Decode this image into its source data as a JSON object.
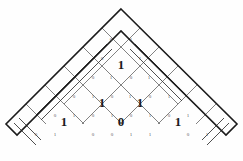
{
  "figure": {
    "type": "diamond-lattice",
    "background_color": "#ffffff",
    "outline_color": "#1b1b1b",
    "grid_color": "#6b6b6b",
    "label_color": "#5a5a5a",
    "digit_color": "#1a1a1a"
  },
  "geometry": {
    "apex": {
      "x": 121,
      "y": 9
    },
    "left_vertex": {
      "x": 6,
      "y": 124
    },
    "right_vertex": {
      "x": 237,
      "y": 124
    },
    "cell_half": 19,
    "rows": 6
  },
  "cells": [
    {
      "id": "cell-r3-c0",
      "x": 121,
      "y": 66,
      "digit": "1"
    },
    {
      "id": "cell-r4-c0",
      "x": 102,
      "y": 104,
      "digit": "1"
    },
    {
      "id": "cell-r4-c1",
      "x": 140,
      "y": 104,
      "digit": "1"
    },
    {
      "id": "cell-r5-c0",
      "x": 64,
      "y": 123,
      "digit": "1"
    },
    {
      "id": "cell-r5-c1",
      "x": 121,
      "y": 123,
      "digit": "0"
    },
    {
      "id": "cell-r5-c2",
      "x": 178,
      "y": 123,
      "digit": "1"
    }
  ],
  "edge_labels": [
    {
      "id": "lbl-1",
      "x": 111,
      "y": 40,
      "text": "0"
    },
    {
      "id": "lbl-2",
      "x": 131,
      "y": 40,
      "text": "1"
    },
    {
      "id": "lbl-3",
      "x": 102,
      "y": 59,
      "text": "0"
    },
    {
      "id": "lbl-4",
      "x": 140,
      "y": 59,
      "text": "1"
    },
    {
      "id": "lbl-5",
      "x": 93,
      "y": 78,
      "text": "0"
    },
    {
      "id": "lbl-6",
      "x": 111,
      "y": 78,
      "text": "1"
    },
    {
      "id": "lbl-7",
      "x": 131,
      "y": 78,
      "text": "0"
    },
    {
      "id": "lbl-8",
      "x": 149,
      "y": 78,
      "text": "1"
    },
    {
      "id": "lbl-9",
      "x": 74,
      "y": 97,
      "text": "0"
    },
    {
      "id": "lbl-10",
      "x": 93,
      "y": 97,
      "text": "1"
    },
    {
      "id": "lbl-11",
      "x": 112,
      "y": 97,
      "text": "0"
    },
    {
      "id": "lbl-12",
      "x": 130,
      "y": 97,
      "text": "1"
    },
    {
      "id": "lbl-13",
      "x": 150,
      "y": 97,
      "text": "0"
    },
    {
      "id": "lbl-14",
      "x": 169,
      "y": 97,
      "text": "1"
    },
    {
      "id": "lbl-15",
      "x": 55,
      "y": 116,
      "text": "0"
    },
    {
      "id": "lbl-16",
      "x": 74,
      "y": 116,
      "text": "1"
    },
    {
      "id": "lbl-17",
      "x": 93,
      "y": 116,
      "text": "0"
    },
    {
      "id": "lbl-18",
      "x": 112,
      "y": 116,
      "text": "1"
    },
    {
      "id": "lbl-19",
      "x": 131,
      "y": 116,
      "text": "0"
    },
    {
      "id": "lbl-20",
      "x": 150,
      "y": 116,
      "text": "1"
    },
    {
      "id": "lbl-21",
      "x": 169,
      "y": 116,
      "text": "0"
    },
    {
      "id": "lbl-22",
      "x": 188,
      "y": 116,
      "text": "1"
    },
    {
      "id": "lbl-23",
      "x": 36,
      "y": 135,
      "text": "0"
    },
    {
      "id": "lbl-24",
      "x": 55,
      "y": 135,
      "text": "1"
    },
    {
      "id": "lbl-25",
      "x": 93,
      "y": 135,
      "text": "0"
    },
    {
      "id": "lbl-26",
      "x": 112,
      "y": 135,
      "text": "0"
    },
    {
      "id": "lbl-27",
      "x": 131,
      "y": 135,
      "text": "1"
    },
    {
      "id": "lbl-28",
      "x": 150,
      "y": 135,
      "text": "1"
    },
    {
      "id": "lbl-29",
      "x": 188,
      "y": 135,
      "text": "0"
    },
    {
      "id": "lbl-30",
      "x": 207,
      "y": 135,
      "text": "1"
    }
  ],
  "outline_path": "M 121 9 L 237 124 L 226 135 L 140 50 L 121 31 L 102 50 L 17 135 L 6 124 Z",
  "grid_paths": [
    "M 102 28 L 178 104",
    "M 83 47 L 197 161",
    "M 64 66 L 178 180",
    "M 45 85 L 159 199",
    "M 26 104 L 140 218",
    "M 140 28 L 64 104",
    "M 159 47 L 45 161",
    "M 178 66 L 64 180",
    "M 197 85 L 83 199",
    "M 216 104 L 102 218"
  ],
  "double_paths": [
    "M 107 44 L 55 96",
    "M 112 49 L 60 101",
    "M 135 44 L 187 96",
    "M 130 49 L 182 101",
    "M 55 96 L 36 115",
    "M 60 101 L 41 120",
    "M 14 123 L 36 145",
    "M 19 118 L 41 140",
    "M 229 123 L 207 145",
    "M 224 118 L 202 140"
  ],
  "legend": {
    "symbol_0": "0",
    "symbol_1": "1"
  }
}
